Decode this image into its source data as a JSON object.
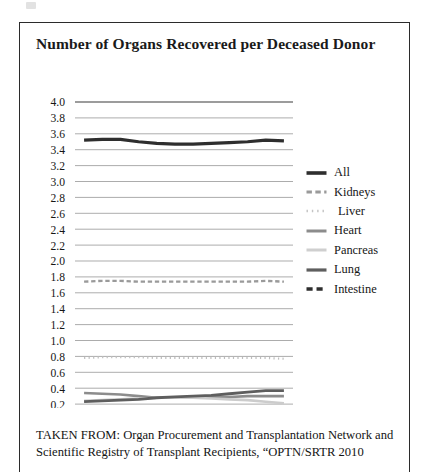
{
  "figure": {
    "title": "Number of Organs Recovered per Deceased Donor",
    "caption": "TAKEN FROM: Organ Procurement and Transplantation Network and Scientific Registry of Transplant Recipients, “OPTN/SRTR 2010"
  },
  "chart_data": {
    "type": "line",
    "title": "Number of Organs Recovered per Deceased Donor",
    "xlabel": "",
    "ylabel": "",
    "ylim": [
      0.0,
      4.0
    ],
    "xlim": [
      1997.5,
      2009.5
    ],
    "grid": true,
    "legend_position": "right",
    "y_ticks": [
      "4.0",
      "3.8",
      "3.6",
      "3.4",
      "3.2",
      "3.0",
      "2.8",
      "2.6",
      "2.4",
      "2.2",
      "2.0",
      "1.8",
      "1.6",
      "1.4",
      "1.2",
      "1.0",
      "0.8",
      "0.6",
      "0.4",
      "0.2",
      "0.0"
    ],
    "y_tick_values": [
      4.0,
      3.8,
      3.6,
      3.4,
      3.2,
      3.0,
      2.8,
      2.6,
      2.4,
      2.2,
      2.0,
      1.8,
      1.6,
      1.4,
      1.2,
      1.0,
      0.8,
      0.6,
      0.4,
      0.2,
      0.0
    ],
    "x_tick_labels": [
      "1998",
      "2000",
      "2002",
      "2004",
      "2006",
      "2008"
    ],
    "x_tick_values": [
      1998,
      2000,
      2002,
      2004,
      2006,
      2008
    ],
    "x": [
      1998,
      1999,
      2000,
      2001,
      2002,
      2003,
      2004,
      2005,
      2006,
      2007,
      2008,
      2009
    ],
    "series": [
      {
        "name": "All",
        "color": "#2e2e2e",
        "width": 3.2,
        "dash": "none",
        "values": [
          3.52,
          3.53,
          3.53,
          3.5,
          3.48,
          3.47,
          3.47,
          3.48,
          3.49,
          3.5,
          3.52,
          3.51
        ]
      },
      {
        "name": "Kidneys",
        "color": "#9a9a9a",
        "width": 2.4,
        "dash": "dashed",
        "values": [
          1.74,
          1.75,
          1.75,
          1.74,
          1.74,
          1.74,
          1.74,
          1.74,
          1.74,
          1.74,
          1.75,
          1.74
        ]
      },
      {
        "name": "Liver",
        "color": "#bdbdbd",
        "width": 2.2,
        "dash": "dotted",
        "values": [
          0.78,
          0.79,
          0.79,
          0.79,
          0.78,
          0.78,
          0.78,
          0.78,
          0.78,
          0.78,
          0.78,
          0.77
        ]
      },
      {
        "name": "Heart",
        "color": "#8c8c8c",
        "width": 2.6,
        "dash": "none",
        "values": [
          0.34,
          0.33,
          0.32,
          0.3,
          0.28,
          0.28,
          0.29,
          0.29,
          0.29,
          0.3,
          0.3,
          0.3
        ]
      },
      {
        "name": "Pancreas",
        "color": "#cccccc",
        "width": 2.6,
        "dash": "none",
        "values": [
          0.24,
          0.25,
          0.26,
          0.27,
          0.28,
          0.28,
          0.28,
          0.27,
          0.26,
          0.25,
          0.23,
          0.21
        ]
      },
      {
        "name": "Lung",
        "color": "#5e5e5e",
        "width": 2.8,
        "dash": "none",
        "values": [
          0.23,
          0.24,
          0.25,
          0.26,
          0.28,
          0.29,
          0.3,
          0.31,
          0.33,
          0.35,
          0.37,
          0.37
        ]
      },
      {
        "name": "Intestine",
        "color": "#2e2e2e",
        "width": 3.0,
        "dash": "dashed",
        "values": [
          0.02,
          0.02,
          0.02,
          0.02,
          0.02,
          0.02,
          0.02,
          0.02,
          0.02,
          0.02,
          0.02,
          0.02
        ]
      }
    ]
  },
  "legend": {
    "items": [
      {
        "label": "All",
        "color": "#2e2e2e",
        "dash": "none",
        "width": 3.6
      },
      {
        "label": "Kidneys",
        "color": "#9a9a9a",
        "dash": "dashed",
        "width": 3.0
      },
      {
        "label": "Liver",
        "color": "#c4c4c4",
        "dash": "dotted",
        "width": 2.6
      },
      {
        "label": "Heart",
        "color": "#8c8c8c",
        "dash": "none",
        "width": 3.0
      },
      {
        "label": "Pancreas",
        "color": "#cfcfcf",
        "dash": "none",
        "width": 3.0
      },
      {
        "label": "Lung",
        "color": "#5e5e5e",
        "dash": "none",
        "width": 3.2
      },
      {
        "label": "Intestine",
        "color": "#2e2e2e",
        "dash": "dashed",
        "width": 3.4
      }
    ]
  }
}
